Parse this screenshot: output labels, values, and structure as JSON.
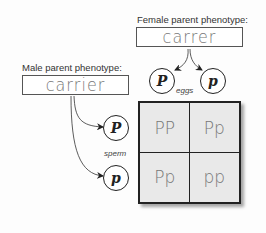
{
  "female_parent": {
    "label": "Female parent phenotype:",
    "value": "carrer"
  },
  "male_parent": {
    "label": "Male parent phenotype:",
    "value": "carrier"
  },
  "eggs": {
    "label": "eggs",
    "alleles": [
      "P",
      "p"
    ]
  },
  "sperm": {
    "label": "sperm",
    "alleles": [
      "P",
      "p"
    ]
  },
  "punnett_square": {
    "cells": [
      [
        "PP",
        "Pp"
      ],
      [
        "Pp",
        "pp"
      ]
    ]
  },
  "colors": {
    "grid_fill": "#e9e9e9",
    "border": "#222222",
    "handwriting": "#777777"
  }
}
